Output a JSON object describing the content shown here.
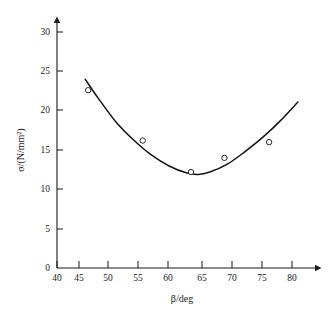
{
  "chart_data": {
    "type": "scatter",
    "title": "",
    "xlabel": "β/deg",
    "ylabel": "σ/(N/mm²)",
    "xlim": [
      40,
      83
    ],
    "ylim": [
      0,
      32
    ],
    "xticks": [
      40,
      45,
      50,
      55,
      60,
      65,
      70,
      75,
      80
    ],
    "yticks": [
      0,
      5,
      10,
      15,
      20,
      25,
      30
    ],
    "xtick_labels": [
      "40",
      "45",
      "50",
      "55",
      "60",
      "65",
      "70",
      "75",
      "80"
    ],
    "ytick_labels": [
      "0",
      "5",
      "10",
      "15",
      "20",
      "25",
      "30"
    ],
    "grid": false,
    "legend": null,
    "axis_arrows": true,
    "series": [
      {
        "name": "measured points",
        "type": "scatter",
        "marker": "open-circle",
        "x": [
          45.3,
          54.6,
          62.8,
          68.5,
          76.1
        ],
        "y": [
          22.6,
          16.2,
          12.2,
          14.0,
          16.0
        ]
      },
      {
        "name": "fitted curve",
        "type": "line",
        "x": [
          44.8,
          47,
          50,
          53,
          56,
          59,
          62,
          64,
          66,
          69,
          72,
          75,
          78,
          81
        ],
        "y": [
          24.0,
          21.6,
          18.6,
          16.3,
          14.4,
          13.0,
          12.1,
          11.9,
          12.2,
          13.2,
          14.8,
          16.6,
          18.7,
          21.1
        ]
      }
    ]
  },
  "axes": {
    "x_axis_name": "beta-axis",
    "y_axis_name": "sigma-axis",
    "x_label_text": "β/deg",
    "y_label_parts": {
      "symbol": "σ",
      "slash": "/(N/mm",
      "sup": "2",
      "close": ")"
    }
  },
  "colors": {
    "ink": "#1b1b1b",
    "curve": "#141414",
    "marker_fill": "#ffffff",
    "background": "#ffffff"
  }
}
